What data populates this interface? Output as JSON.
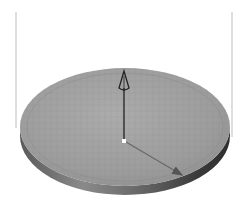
{
  "scene": {
    "description": "3D rendered disc with a normal vector arrow and a diagonal arrow on its surface",
    "colors": {
      "background": "#ffffff",
      "disc_top": "#9a9a9a",
      "disc_top_light": "#aaaaaa",
      "disc_edge_dark": "#3a3a3a",
      "disc_edge_mid": "#707070",
      "disc_edge_light": "#8a8a8a",
      "arrow": "#2a2a2a",
      "guide_line": "#c8c8c8",
      "origin_point": "#ffffff"
    },
    "disc": {
      "cx": 125,
      "cy": 127,
      "rx": 105,
      "ry": 59,
      "thickness": 9
    },
    "normal_arrow": {
      "x": 124,
      "y1": 140,
      "y2": 71
    },
    "surface_arrow": {
      "x1": 126,
      "y1": 142,
      "x2": 182,
      "y2": 175
    },
    "guide_lines": [
      {
        "x": 16,
        "y1": 12,
        "y2": 128
      },
      {
        "x": 232,
        "y1": 12,
        "y2": 137
      }
    ]
  }
}
